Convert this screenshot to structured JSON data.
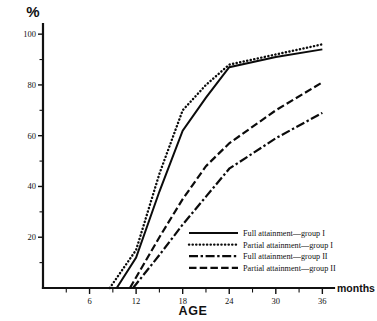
{
  "chart_data": {
    "type": "line",
    "title": "",
    "xlabel": "AGE",
    "x_units": "months",
    "ylabel": "%",
    "xlim": [
      0,
      37.5
    ],
    "ylim": [
      0,
      104
    ],
    "grid": false,
    "legend_position": "inside-bottom-right",
    "x_ticks_major": [
      6,
      12,
      18,
      24,
      30,
      36
    ],
    "x_ticks_minor": [
      3,
      9,
      15,
      21,
      27,
      33
    ],
    "y_ticks_major": [
      20,
      40,
      60,
      80,
      100
    ],
    "y_ticks_minor": [
      10,
      30,
      50,
      70,
      90
    ],
    "x_tick_labels": [
      "6",
      "12",
      "18",
      "24",
      "30",
      "36"
    ],
    "y_tick_labels": [
      "20",
      "40",
      "60",
      "80",
      "100"
    ],
    "series": [
      {
        "name": "Full attainment—group I",
        "style": "solid",
        "x": [
          9.5,
          12,
          15,
          18,
          21,
          24,
          30,
          36
        ],
        "values": [
          0,
          12,
          38,
          62,
          75,
          87,
          91,
          94
        ]
      },
      {
        "name": "Partial attainment—group I",
        "style": "dotted",
        "x": [
          8.6,
          12,
          15,
          18,
          21,
          24,
          30,
          36
        ],
        "values": [
          0,
          15,
          45,
          70,
          80,
          88,
          92,
          96
        ]
      },
      {
        "name": "Full attainment—group II",
        "style": "dash-dot",
        "x": [
          11.6,
          15,
          18,
          21,
          24,
          30,
          36
        ],
        "values": [
          0,
          13,
          25,
          36,
          47,
          59,
          69
        ]
      },
      {
        "name": "Partial attainment—group II",
        "style": "dashed",
        "x": [
          11.2,
          15,
          18,
          21,
          24,
          30,
          36
        ],
        "values": [
          0,
          20,
          35,
          48,
          57,
          70,
          81
        ]
      }
    ]
  },
  "axis": {
    "y_unit_symbol": "%",
    "x_axis_title": "AGE",
    "x_axis_units": "months"
  },
  "legend": {
    "entries": [
      {
        "label": "Full attainment—group I",
        "style": "solid"
      },
      {
        "label": "Partial attainment—group I",
        "style": "dotted"
      },
      {
        "label": "Full attainment—group II",
        "style": "dash-dot"
      },
      {
        "label": "Partial attainment—group II",
        "style": "dashed"
      }
    ]
  },
  "colors": {
    "ink": "#111111",
    "background": "#ffffff"
  }
}
